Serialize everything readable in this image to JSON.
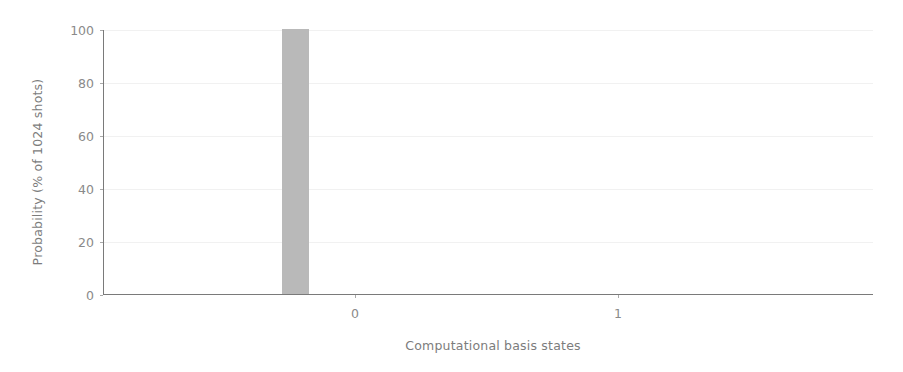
{
  "chart_data": {
    "type": "bar",
    "title": "",
    "xlabel": "Computational basis states",
    "ylabel": "Probability (% of 1024 shots)",
    "categories": [
      "0",
      "1"
    ],
    "values": [
      100,
      0
    ],
    "series": [
      {
        "name": "counts",
        "values": [
          100,
          0
        ]
      }
    ],
    "xlim": [
      -0.5,
      1.5
    ],
    "ylim": [
      0,
      100
    ],
    "yticks": [
      0,
      20,
      40,
      60,
      80,
      100
    ],
    "ytick_labels": [
      "0",
      "20",
      "40",
      "60",
      "80",
      "100"
    ],
    "xticks": [
      0,
      1
    ],
    "xtick_labels": [
      "0",
      "1"
    ],
    "grid": true,
    "grid_axis": "y",
    "legend": "none",
    "bar_color": "#b9b9b9",
    "axis_color": "#7a7a7a",
    "grid_color": "#f1f1f1",
    "tick_label_color": "#8a8a8a",
    "axis_label_color": "#7c7c7c",
    "background_color": "#ffffff"
  }
}
